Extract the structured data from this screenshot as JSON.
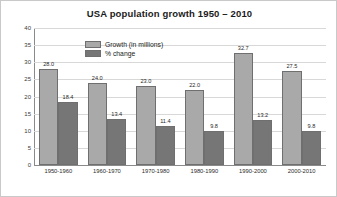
{
  "chart_data": {
    "type": "bar",
    "title": "USA population growth 1950 – 2010",
    "xlabel": "",
    "ylabel": "",
    "ylim": [
      0,
      40
    ],
    "yticks": [
      0,
      5,
      10,
      15,
      20,
      25,
      30,
      35,
      40
    ],
    "grid": true,
    "legend_position": "top-center-inside",
    "categories": [
      "1950-1960",
      "1960-1970",
      "1970-1980",
      "1980-1990",
      "1990-2000",
      "2000-2010"
    ],
    "series": [
      {
        "name": "Growth (in millions)",
        "color": "#a9a9a9",
        "values": [
          28.0,
          24.0,
          23.0,
          22.0,
          32.7,
          27.5
        ],
        "labels": [
          "28.0",
          "24.0",
          "23.0",
          "22.0",
          "32.7",
          "27.5"
        ]
      },
      {
        "name": "% change",
        "color": "#767676",
        "values": [
          18.4,
          13.4,
          11.4,
          9.8,
          13.2,
          9.8
        ],
        "labels": [
          "18.4",
          "13.4",
          "11.4",
          "9.8",
          "13.2",
          "9.8"
        ]
      }
    ]
  },
  "colors": {
    "growth_fill": "#a9a9a9",
    "pct_fill": "#767676",
    "bar_border": "#6f6f6f",
    "gridline": "#d8d8d8",
    "axis": "#8a8a8a",
    "card_border": "#c9c9c9",
    "background": "#ffffff",
    "text": "#1b1b1b"
  }
}
